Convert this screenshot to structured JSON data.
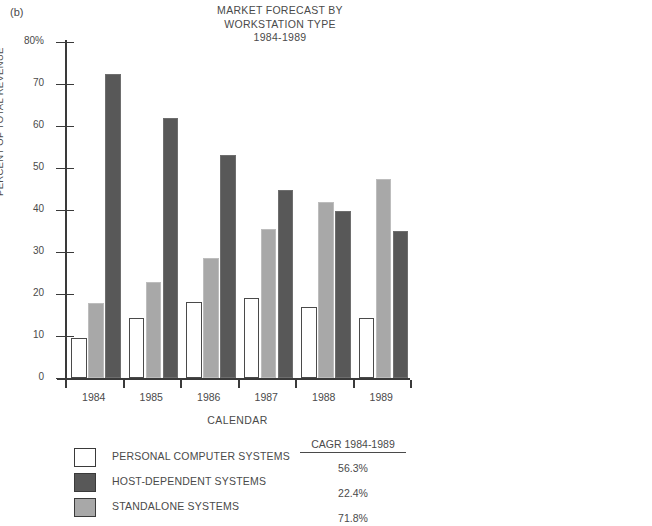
{
  "figure_label": "(b)",
  "title_lines": [
    "MARKET FORECAST BY",
    "WORKSTATION TYPE",
    "1984-1989"
  ],
  "axes": {
    "y_title": "PERCENT OF TOTAL REVENUE",
    "x_title": "CALENDAR",
    "y_tick_labels": [
      "80%",
      "70",
      "60",
      "50",
      "40",
      "30",
      "20",
      "10",
      "0"
    ]
  },
  "legend": {
    "cagr_header": "CAGR 1984-1989",
    "rows": [
      {
        "label": "PERSONAL COMPUTER SYSTEMS",
        "swatch": "pc",
        "cagr": "56.3%"
      },
      {
        "label": "HOST-DEPENDENT SYSTEMS",
        "swatch": "host",
        "cagr": "22.4%"
      },
      {
        "label": "STANDALONE SYSTEMS",
        "swatch": "standalone",
        "cagr": "71.8%"
      }
    ]
  },
  "chart_data": {
    "type": "bar",
    "title": "MARKET FORECAST BY WORKSTATION TYPE 1984-1989",
    "xlabel": "CALENDAR",
    "ylabel": "PERCENT OF TOTAL REVENUE",
    "ylim": [
      0,
      80
    ],
    "ytick_step": 10,
    "grid": false,
    "legend_position": "below-left",
    "categories": [
      "1984",
      "1985",
      "1986",
      "1987",
      "1988",
      "1989"
    ],
    "series": [
      {
        "name": "PERSONAL COMPUTER SYSTEMS",
        "color": "#ffffff",
        "cagr": "56.3%",
        "values": [
          9.5,
          14.3,
          18.0,
          19.0,
          16.8,
          14.3
        ]
      },
      {
        "name": "STANDALONE SYSTEMS",
        "color": "#a8a8a8",
        "cagr": "71.8%",
        "values": [
          17.9,
          22.8,
          28.5,
          35.5,
          42.0,
          47.5
        ]
      },
      {
        "name": "HOST-DEPENDENT SYSTEMS",
        "color": "#585858",
        "cagr": "22.4%",
        "values": [
          72.5,
          62.0,
          53.0,
          44.7,
          39.7,
          35.1
        ]
      }
    ]
  }
}
